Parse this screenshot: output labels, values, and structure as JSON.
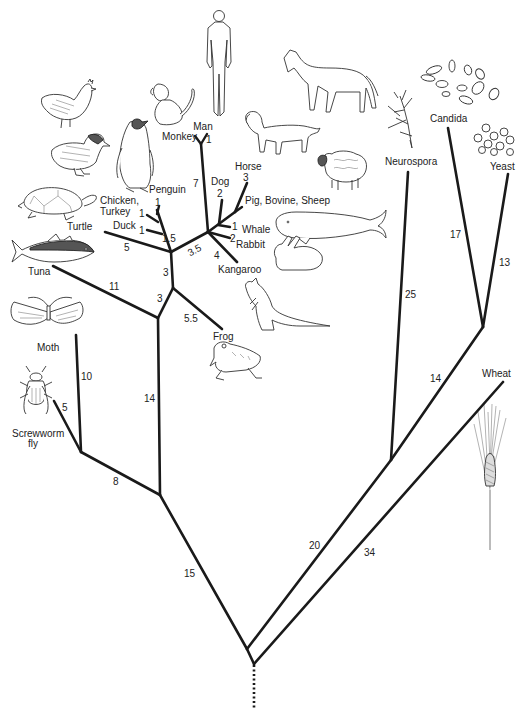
{
  "diagram": {
    "type": "phylogenetic-tree",
    "taxa": [
      {
        "id": "man",
        "label": "Man"
      },
      {
        "id": "monkey",
        "label": "Monkey"
      },
      {
        "id": "dog",
        "label": "Dog"
      },
      {
        "id": "horse",
        "label": "Horse"
      },
      {
        "id": "pig",
        "label": "Pig, Bovine, Sheep"
      },
      {
        "id": "whale",
        "label": "Whale"
      },
      {
        "id": "rabbit",
        "label": "Rabbit"
      },
      {
        "id": "kangaroo",
        "label": "Kangaroo"
      },
      {
        "id": "penguin",
        "label": "Penguin"
      },
      {
        "id": "chicken",
        "label_line1": "Chicken,",
        "label_line2": "Turkey"
      },
      {
        "id": "duck",
        "label": "Duck"
      },
      {
        "id": "turtle",
        "label": "Turtle"
      },
      {
        "id": "tuna",
        "label": "Tuna"
      },
      {
        "id": "frog",
        "label": "Frog"
      },
      {
        "id": "moth",
        "label": "Moth"
      },
      {
        "id": "screwworm",
        "label_line1": "Screwworm",
        "label_line2": "fly"
      },
      {
        "id": "neurospora",
        "label": "Neurospora"
      },
      {
        "id": "candida",
        "label": "Candida"
      },
      {
        "id": "yeast",
        "label": "Yeast"
      },
      {
        "id": "wheat",
        "label": "Wheat"
      }
    ],
    "branch_lengths": {
      "man": "1",
      "monkey_man_stem": "7",
      "dog": "2",
      "horse": "3",
      "whale": "1",
      "rabbit": "2",
      "kangaroo": "4",
      "mammals_stem": "3.5",
      "penguin": "1",
      "chicken": "1",
      "duck": "1",
      "birds_stem": "1.5",
      "turtle": "5",
      "amniote_stem": "3",
      "frog": "5.5",
      "tetrapod_stem": "3",
      "tuna": "11",
      "vertebrate_stem": "14",
      "moth": "10",
      "screwworm": "5",
      "insects_stem": "8",
      "animals_stem": "15",
      "neurospora": "25",
      "candida": "17",
      "yeast": "13",
      "yeasts_stem": "14",
      "fungi_stem": "20",
      "wheat": "34"
    }
  }
}
